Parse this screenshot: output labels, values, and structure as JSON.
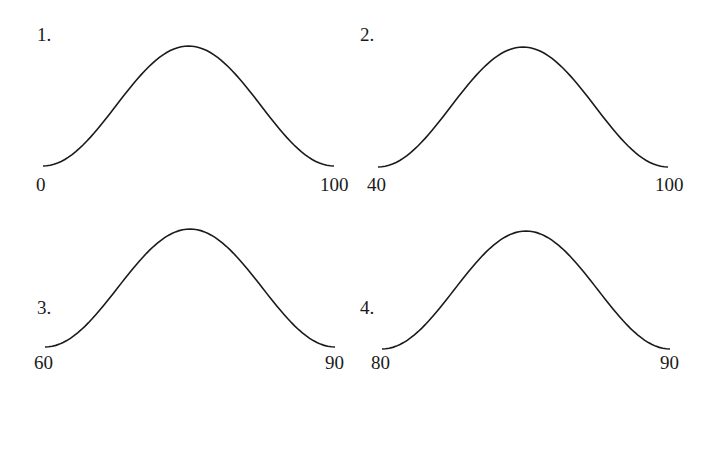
{
  "diagram": {
    "type": "bell-curve-set",
    "panels": [
      {
        "number": "1.",
        "left_label": "0",
        "right_label": "100"
      },
      {
        "number": "2.",
        "left_label": "40",
        "right_label": "100"
      },
      {
        "number": "3.",
        "left_label": "60",
        "right_label": "90"
      },
      {
        "number": "4.",
        "left_label": "80",
        "right_label": "90"
      }
    ]
  }
}
